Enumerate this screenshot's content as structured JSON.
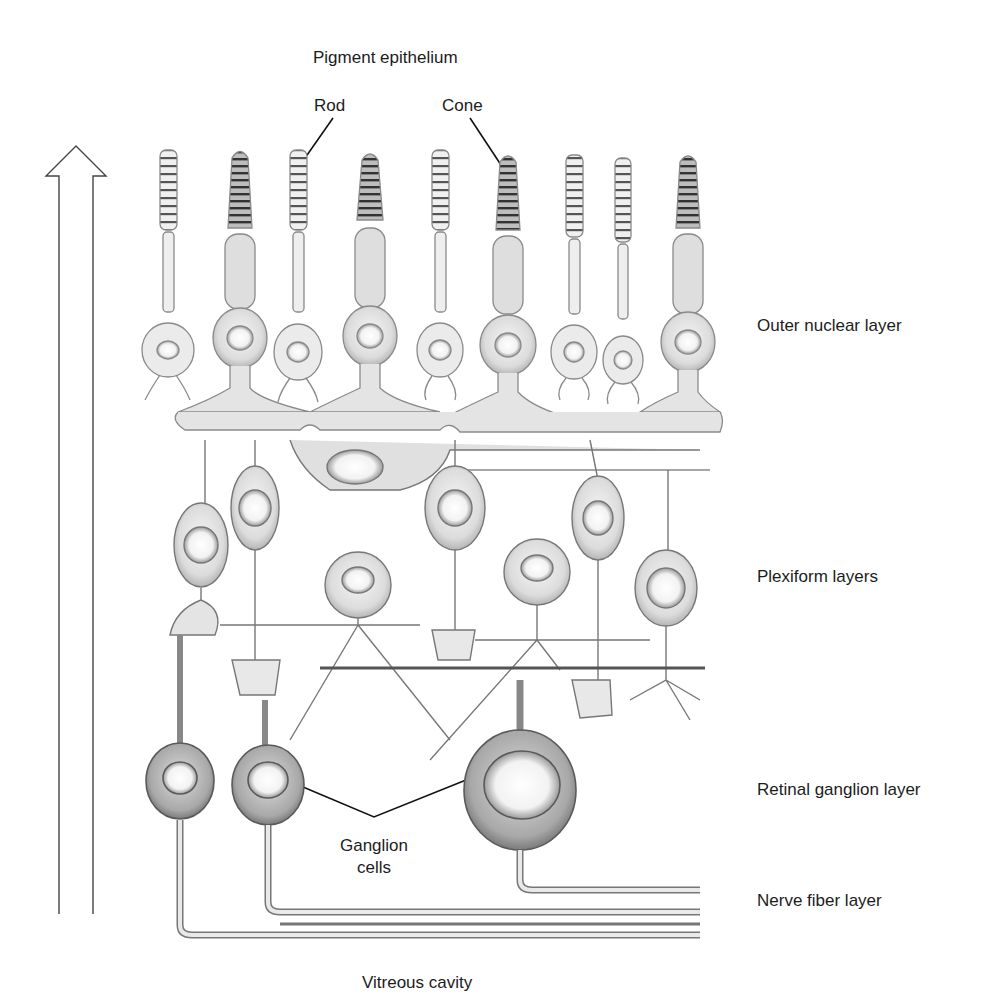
{
  "diagram": {
    "arrow": {
      "label": "LIGHT",
      "direction": "up"
    },
    "top_labels": {
      "pigment": "Pigment epithelium",
      "rod": "Rod",
      "cone": "Cone"
    },
    "layer_labels": [
      {
        "id": "outer-nuclear",
        "text": "Outer nuclear layer"
      },
      {
        "id": "plexiform",
        "text": "Plexiform layers"
      },
      {
        "id": "ganglion-layer",
        "text": "Retinal ganglion layer"
      },
      {
        "id": "nerve-fiber",
        "text": "Nerve fiber layer"
      }
    ],
    "ganglion_callout": {
      "line1": "Ganglion",
      "line2": "cells"
    },
    "bottom_label": "Vitreous cavity",
    "photoreceptors": [
      {
        "type": "rod",
        "x": 168
      },
      {
        "type": "cone",
        "x": 240
      },
      {
        "type": "rod",
        "x": 298
      },
      {
        "type": "cone",
        "x": 370
      },
      {
        "type": "rod",
        "x": 440
      },
      {
        "type": "cone",
        "x": 508
      },
      {
        "type": "rod",
        "x": 574
      },
      {
        "type": "rod",
        "x": 623
      },
      {
        "type": "cone",
        "x": 688
      }
    ],
    "colors": {
      "outline": "#6e6e6e",
      "fill": "#e2e2e2",
      "dark": "#4a4a4a",
      "text": "#1c1c1c"
    }
  }
}
